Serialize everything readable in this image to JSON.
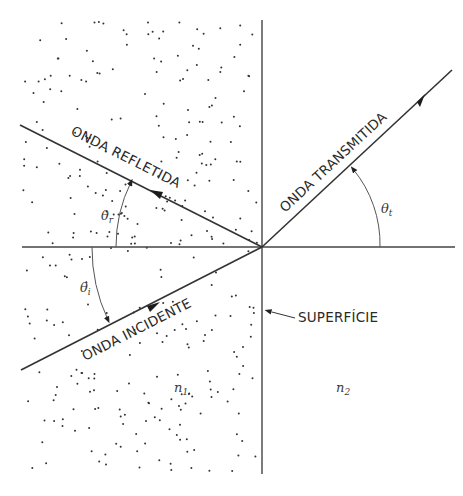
{
  "diagram": {
    "type": "refraction-reflection",
    "labels": {
      "reflected_wave": "ONDA REFLETIDA",
      "transmitted_wave": "ONDA TRANSMITIDA",
      "incident_wave": "ONDA INCIDENTE",
      "surface": "SUPERFÍCIE",
      "n1_base": "n",
      "n1_sub": "1",
      "n2_base": "n",
      "n2_sub": "2",
      "theta_r_base": "θ",
      "theta_r_sub": "r",
      "theta_i_base": "θ",
      "theta_i_sub": "i",
      "theta_t_base": "θ",
      "theta_t_sub": "t"
    },
    "angles_deg": {
      "incident": 27,
      "reflected": 27,
      "transmitted": 43
    },
    "medium_1_dotted": true,
    "medium_2_dotted": false,
    "colors": {
      "ink": "#333333",
      "background": "#ffffff"
    }
  }
}
